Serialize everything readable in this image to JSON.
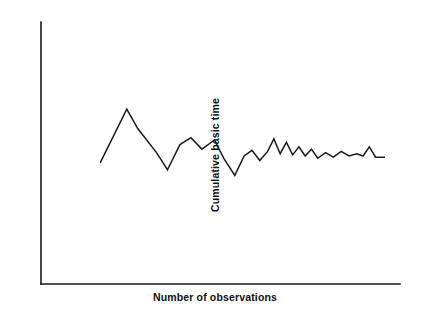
{
  "figure": {
    "background_color": "#ffffff",
    "ink_color": "#1a1a1a"
  },
  "chart_data": {
    "type": "line",
    "title": "",
    "subtitle": "",
    "xlabel": "Number of observations",
    "ylabel": "Cumulative basic time",
    "grid": false,
    "legend": null,
    "annotations": [],
    "axis_style": "open-L (left spine and bottom spine only)",
    "ticks": {
      "x": [],
      "y": [],
      "note": "Axes are unlabelled and unticked; the figure is schematic."
    },
    "xlim": [
      0,
      100
    ],
    "ylim": [
      0,
      100
    ],
    "series": [
      {
        "name": "Cumulative basic time",
        "color": "#1b1b1b",
        "x": [
          9.0,
          17.5,
          21.0,
          27.0,
          30.5,
          34.5,
          38.0,
          41.5,
          45.5,
          48.5,
          52.0,
          55.0,
          57.5,
          60.0,
          62.5,
          64.5,
          66.5,
          68.5,
          70.5,
          72.5,
          74.5,
          76.5,
          78.5,
          81.0,
          83.5,
          86.0,
          88.5,
          91.0,
          93.0,
          95.0,
          97.0,
          100.0
        ],
        "y": [
          42.5,
          66.0,
          57.5,
          47.0,
          39.5,
          50.5,
          53.5,
          48.5,
          52.5,
          44.5,
          37.0,
          45.5,
          48.0,
          43.5,
          47.5,
          53.0,
          46.5,
          51.5,
          46.0,
          49.5,
          45.5,
          48.5,
          44.5,
          47.0,
          45.0,
          47.5,
          45.5,
          46.5,
          45.5,
          49.5,
          45.0,
          45.0
        ]
      }
    ]
  },
  "labels": {
    "x_axis": "Number of observations",
    "y_axis": "Cumulative basic time"
  }
}
